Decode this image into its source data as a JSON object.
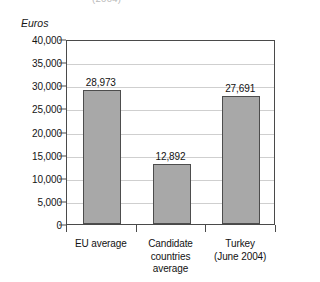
{
  "clipped_title": "(2004)",
  "axis_unit_label": "Euros",
  "colors": {
    "bar_fill": "#a8a8a8",
    "bar_border": "#4d4d4d",
    "frame": "#4a4a4a",
    "gridline": "#cfcfcf",
    "text": "#121212",
    "background": "#ffffff"
  },
  "chart_data": {
    "type": "bar",
    "title": "",
    "xlabel": "",
    "ylabel": "Euros",
    "categories": [
      "EU average",
      "Candidate\ncountries\naverage",
      "Turkey\n(June 2004)"
    ],
    "values": [
      28973,
      12892,
      27691
    ],
    "value_labels": [
      "28,973",
      "12,892",
      "27,691"
    ],
    "ylim": [
      0,
      40000
    ],
    "ytick_values": [
      0,
      5000,
      10000,
      15000,
      20000,
      25000,
      30000,
      35000,
      40000
    ],
    "ytick_labels": [
      "0",
      "5,000",
      "10,000",
      "15,000",
      "20,000",
      "25,000",
      "30,000",
      "35,000",
      "40,000"
    ],
    "grid": true,
    "legend": false,
    "legend_position": "none",
    "orientation": "vertical"
  }
}
